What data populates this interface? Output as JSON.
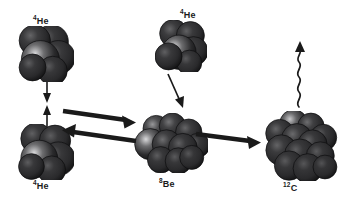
{
  "figure": {
    "background_color": "#ffffff",
    "ink_color": "#1a1a1a",
    "width": 345,
    "height": 208
  },
  "nuclides": [
    {
      "id": "he4-top-left",
      "mass_number": "4",
      "symbol": "He",
      "label": "He",
      "nucleon_count": 4,
      "label_x": 33,
      "label_y": 17,
      "cluster_x": 18,
      "cluster_y": 26,
      "cluster_w": 56,
      "cluster_h": 56
    },
    {
      "id": "he4-bottom-left",
      "mass_number": "4",
      "symbol": "He",
      "label": "He",
      "nucleon_count": 4,
      "label_x": 33,
      "label_y": 182,
      "cluster_x": 18,
      "cluster_y": 124,
      "cluster_w": 56,
      "cluster_h": 56
    },
    {
      "id": "he4-top-middle",
      "mass_number": "4",
      "symbol": "He",
      "label": "He",
      "nucleon_count": 4,
      "label_x": 180,
      "label_y": 11,
      "cluster_x": 155,
      "cluster_y": 20,
      "cluster_w": 52,
      "cluster_h": 52
    },
    {
      "id": "be8",
      "mass_number": "8",
      "symbol": "Be",
      "label": "Be",
      "nucleon_count": 8,
      "label_x": 159,
      "label_y": 180,
      "cluster_x": 134,
      "cluster_y": 113,
      "cluster_w": 74,
      "cluster_h": 60
    },
    {
      "id": "c12",
      "mass_number": "12",
      "symbol": "C",
      "label": "C",
      "nucleon_count": 12,
      "label_x": 283,
      "label_y": 184,
      "cluster_x": 261,
      "cluster_y": 111,
      "cluster_w": 78,
      "cluster_h": 70
    }
  ],
  "arrows": [
    {
      "id": "he4-down-arrow",
      "name": "arrow-he4-downward",
      "kind": "straight",
      "direction": "down",
      "thin": true
    },
    {
      "id": "he4-up-arrow",
      "name": "arrow-he4-upward",
      "kind": "straight",
      "direction": "up",
      "thin": true
    },
    {
      "id": "fusion-forward-arrow",
      "name": "arrow-he4-he4-to-be8",
      "kind": "thick",
      "direction": "right"
    },
    {
      "id": "fission-back-arrow",
      "name": "arrow-be8-to-he4-he4",
      "kind": "thick",
      "direction": "left"
    },
    {
      "id": "alpha-capture-arrow",
      "name": "arrow-he4-to-be8",
      "kind": "thin-diagonal",
      "direction": "down-right"
    },
    {
      "id": "be8-to-c12-arrow",
      "name": "arrow-be8-to-c12",
      "kind": "thick",
      "direction": "right"
    },
    {
      "id": "gamma-emission",
      "name": "gamma-ray-wavy-arrow",
      "kind": "wavy",
      "direction": "up"
    }
  ]
}
